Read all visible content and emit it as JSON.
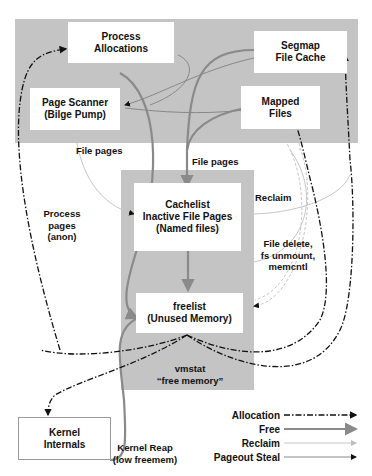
{
  "regions": {
    "top_band": {
      "label": "kernel-managed page sources",
      "color": "#c4c4c4"
    },
    "free_memory_column": {
      "color": "#c4c4c4"
    }
  },
  "nodes": {
    "process_allocations": "Process\nAllocations",
    "segmap_file_cache": "Segmap\nFile Cache",
    "page_scanner": "Page Scanner\n(Bilge Pump)",
    "mapped_files": "Mapped\nFiles",
    "cachelist": "Cachelist\nInactive File Pages\n(Named files)",
    "freelist": "freelist\n(Unused Memory)",
    "kernel_internals": "Kernel\nInternals"
  },
  "edge_labels": {
    "file_pages_left": "File pages",
    "file_pages_center": "File pages",
    "reclaim": "Reclaim",
    "file_delete": "File delete,\nfs unmount,\nmemcntl",
    "process_pages": "Process\npages\n(anon)",
    "vmstat_free_memory": "vmstat\n“free memory”",
    "kernel_reap": "Kernel Reap\n(low freemem)"
  },
  "legend": {
    "items": [
      {
        "label": "Allocation",
        "style": "dash-dot",
        "color": "#111111"
      },
      {
        "label": "Free",
        "style": "solid-thick",
        "color": "#8a8a8a"
      },
      {
        "label": "Reclaim",
        "style": "solid-thin",
        "color": "#bdbdbd"
      },
      {
        "label": "Pageout Steal",
        "style": "solid-thin",
        "color": "#888888"
      }
    ]
  },
  "colors": {
    "region_gray": "#c4c4c4",
    "allocation": "#111111",
    "free": "#8a8a8a",
    "reclaim": "#bdbdbd",
    "pageout": "#888888"
  }
}
